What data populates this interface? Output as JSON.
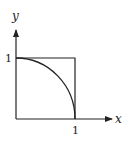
{
  "diagram": {
    "axes": {
      "x_label": "x",
      "y_label": "y"
    },
    "ticks": {
      "x_tick": "1",
      "y_tick": "1"
    },
    "shapes": [
      "unit-square",
      "quarter-circle-arc"
    ],
    "stroke_color": "#222222"
  }
}
